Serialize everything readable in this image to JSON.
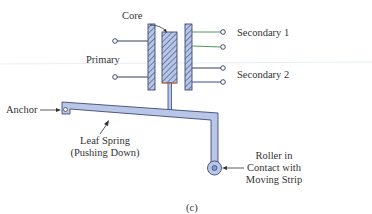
{
  "figure": {
    "caption": "(c)",
    "labels": {
      "core": "Core",
      "primary": "Primary",
      "secondary1": "Secondary 1",
      "secondary2": "Secondary 2",
      "anchor": "Anchor",
      "leaf_spring_line1": "Leaf Spring",
      "leaf_spring_line2": "(Pushing Down)",
      "roller_line1": "Roller in",
      "roller_line2": "Contact with",
      "roller_line3": "Moving Strip"
    },
    "colors": {
      "part_fill": "#b9c6e6",
      "part_stroke": "#3b4a7a",
      "wire": "#333a5c",
      "secondary1_wire": "#4f9a5a",
      "secondary2_wire": "#3a46a8",
      "core_bottom": "#e07a2a"
    }
  }
}
